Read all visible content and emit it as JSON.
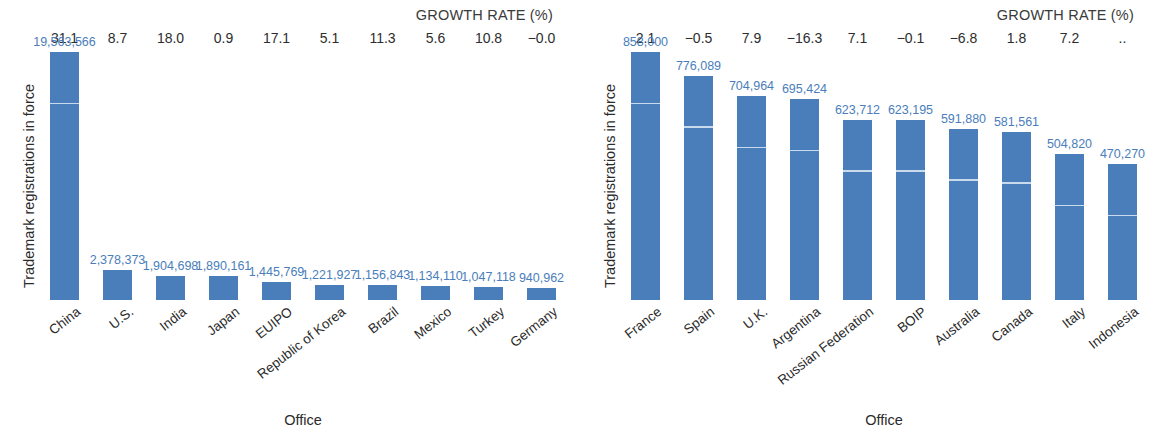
{
  "colors": {
    "bar": "#4a7ebb",
    "value_label": "#4a7ebb",
    "text": "#2b2b2b",
    "background": "#ffffff",
    "bar_seam": "#dfeaf4"
  },
  "chart_data": [
    {
      "type": "bar",
      "panel": "left",
      "title": "",
      "growth_header": "GROWTH RATE (%)",
      "ylabel": "Trademark registrations in force",
      "xlabel": "Office",
      "grid": false,
      "legend": "none",
      "ylim": [
        0,
        19563566
      ],
      "categories": [
        "China",
        "U.S.",
        "India",
        "Japan",
        "EUIPO",
        "Republic of Korea",
        "Brazil",
        "Mexico",
        "Turkey",
        "Germany"
      ],
      "values": [
        19563566,
        2378373,
        1904698,
        1890161,
        1445769,
        1221927,
        1156843,
        1134110,
        1047118,
        940962
      ],
      "value_labels": [
        "19,563,566",
        "2,378,373",
        "1,904,698",
        "1,890,161",
        "1,445,769",
        "1,221,927",
        "1,156,843",
        "1,134,110",
        "1,047,118",
        "940,962"
      ],
      "growth_rates": [
        "31.1",
        "8.7",
        "18.0",
        "0.9",
        "17.1",
        "5.1",
        "11.3",
        "5.6",
        "10.8",
        "−0.0"
      ]
    },
    {
      "type": "bar",
      "panel": "right",
      "title": "",
      "growth_header": "GROWTH RATE (%)",
      "ylabel": "Trademark registrations in force",
      "xlabel": "Office",
      "grid": false,
      "legend": "none",
      "ylim": [
        0,
        858000
      ],
      "categories": [
        "France",
        "Spain",
        "U.K.",
        "Argentina",
        "Russian Federation",
        "BOIP",
        "Australia",
        "Canada",
        "Italy",
        "Indonesia"
      ],
      "values": [
        858000,
        776089,
        704964,
        695424,
        623712,
        623195,
        591880,
        581561,
        504820,
        470270
      ],
      "value_labels": [
        "858,000",
        "776,089",
        "704,964",
        "695,424",
        "623,712",
        "623,195",
        "591,880",
        "581,561",
        "504,820",
        "470,270"
      ],
      "growth_rates": [
        "2.1",
        "−0.5",
        "7.9",
        "−16.3",
        "7.1",
        "−0.1",
        "−6.8",
        "1.8",
        "7.2",
        ".."
      ]
    }
  ]
}
